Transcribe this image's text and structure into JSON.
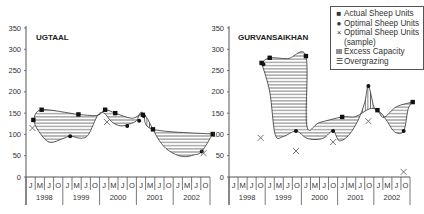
{
  "legend": {
    "items": [
      {
        "symbol": "■",
        "label": "Actual Sheep Units"
      },
      {
        "symbol": "●",
        "label": "Optimal Sheep Units"
      },
      {
        "symbol": "×",
        "label": "Optimal Sheep Units"
      },
      {
        "symbol": "",
        "label": "(sample)"
      },
      {
        "symbol": "III",
        "label": "Excess Capacity"
      },
      {
        "symbol": "☰",
        "label": "Overgrazing"
      }
    ]
  },
  "chart_data": [
    {
      "type": "line",
      "title": "UGTAAL",
      "xlabel": "",
      "ylabel": "",
      "ylim": [
        0,
        350
      ],
      "yticks": [
        0,
        50,
        100,
        150,
        200,
        250,
        300,
        350
      ],
      "quarter_labels": [
        "J",
        "M",
        "J",
        "O"
      ],
      "years": [
        "1998",
        "1999",
        "2000",
        "2001",
        "2002"
      ],
      "x_unit": "quarter index (0 = Jan 1998, 19 = Oct 2002)",
      "series": [
        {
          "name": "Actual Sheep Units",
          "marker": "square",
          "points": [
            [
              0.3,
              134
            ],
            [
              1.2,
              158
            ],
            [
              5.2,
              147
            ],
            [
              8.1,
              158
            ],
            [
              9.2,
              150
            ],
            [
              12.2,
              146
            ],
            [
              13.3,
              112
            ],
            [
              19.8,
              101
            ]
          ]
        },
        {
          "name": "Optimal Sheep Units",
          "marker": "circle",
          "points": [
            [
              4.3,
              96
            ],
            [
              10.5,
              120
            ],
            [
              11.8,
              132
            ],
            [
              12.3,
              143
            ],
            [
              18.6,
              60
            ]
          ]
        },
        {
          "name": "Optimal Sheep Units (sample)",
          "marker": "x",
          "points": [
            [
              0.2,
              115
            ],
            [
              8.3,
              129
            ],
            [
              18.8,
              56
            ]
          ]
        }
      ],
      "curves": {
        "actual": [
          [
            0.3,
            134
          ],
          [
            1.2,
            158
          ],
          [
            5.2,
            147
          ],
          [
            7.3,
            145
          ],
          [
            8.1,
            158
          ],
          [
            9.2,
            150
          ],
          [
            11.0,
            138
          ],
          [
            12.2,
            146
          ],
          [
            13.3,
            112
          ],
          [
            19.8,
            101
          ]
        ],
        "optimal": [
          [
            0.3,
            134
          ],
          [
            0.8,
            110
          ],
          [
            2.0,
            82
          ],
          [
            3.5,
            90
          ],
          [
            4.3,
            96
          ],
          [
            5.5,
            91
          ],
          [
            6.3,
            100
          ],
          [
            7.3,
            145
          ],
          [
            8.0,
            150
          ],
          [
            8.8,
            130
          ],
          [
            9.8,
            120
          ],
          [
            10.8,
            125
          ],
          [
            11.5,
            132
          ],
          [
            12.0,
            152
          ],
          [
            12.6,
            140
          ],
          [
            13.3,
            112
          ],
          [
            14.0,
            85
          ],
          [
            15.0,
            62
          ],
          [
            16.5,
            48
          ],
          [
            17.8,
            52
          ],
          [
            18.6,
            60
          ],
          [
            19.8,
            101
          ]
        ]
      }
    },
    {
      "type": "line",
      "title": "GURVANSAIKHAN",
      "xlabel": "",
      "ylabel": "",
      "ylim": [
        0,
        350
      ],
      "yticks": [
        0,
        50,
        100,
        150,
        200,
        250,
        300,
        350
      ],
      "quarter_labels": [
        "J",
        "M",
        "J",
        "O"
      ],
      "years": [
        "1998",
        "1999",
        "2000",
        "2001",
        "2002"
      ],
      "x_unit": "quarter index (0 = Jan 1998, 19 = Oct 2002)",
      "series": [
        {
          "name": "Actual Sheep Units",
          "marker": "square",
          "points": [
            [
              3.1,
              268
            ],
            [
              4.0,
              280
            ],
            [
              8.0,
              284
            ],
            [
              12.0,
              141
            ],
            [
              15.9,
              157
            ],
            [
              19.8,
              176
            ]
          ]
        },
        {
          "name": "Optimal Sheep Units",
          "marker": "circle",
          "points": [
            [
              3.3,
              265
            ],
            [
              6.9,
              108
            ],
            [
              11.0,
              108
            ],
            [
              14.9,
              214
            ],
            [
              18.8,
              108
            ]
          ]
        },
        {
          "name": "Optimal Sheep Units (sample)",
          "marker": "x",
          "points": [
            [
              3.0,
              92
            ],
            [
              6.9,
              61
            ],
            [
              11.0,
              82
            ],
            [
              14.9,
              131
            ],
            [
              18.8,
              12
            ]
          ]
        }
      ],
      "curves": {
        "actual": [
          [
            3.1,
            268
          ],
          [
            4.0,
            280
          ],
          [
            6.0,
            278
          ],
          [
            8.0,
            284
          ],
          [
            8.1,
            120
          ],
          [
            9.5,
            128
          ],
          [
            12.0,
            141
          ],
          [
            13.5,
            142
          ],
          [
            15.0,
            160
          ],
          [
            15.9,
            157
          ],
          [
            16.6,
            140
          ],
          [
            18.0,
            165
          ],
          [
            19.8,
            176
          ]
        ],
        "optimal": [
          [
            3.1,
            268
          ],
          [
            4.0,
            200
          ],
          [
            4.6,
            100
          ],
          [
            5.5,
            95
          ],
          [
            6.9,
            108
          ],
          [
            8.0,
            92
          ],
          [
            9.0,
            88
          ],
          [
            10.0,
            92
          ],
          [
            11.0,
            108
          ],
          [
            11.7,
            85
          ],
          [
            12.8,
            100
          ],
          [
            13.8,
            135
          ],
          [
            14.5,
            175
          ],
          [
            14.9,
            214
          ],
          [
            15.5,
            165
          ],
          [
            15.9,
            157
          ],
          [
            16.4,
            148
          ],
          [
            17.0,
            130
          ],
          [
            17.8,
            106
          ],
          [
            18.8,
            108
          ],
          [
            19.3,
            160
          ],
          [
            19.8,
            176
          ]
        ]
      }
    }
  ]
}
